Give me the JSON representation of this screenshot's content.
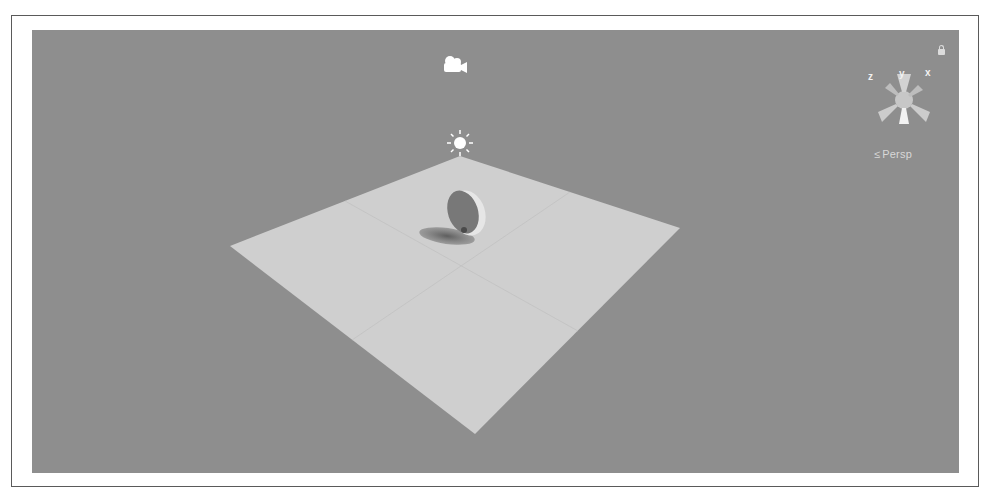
{
  "viewport": {
    "background_color": "#8e8e8e",
    "frame_color": "#5a5a5a",
    "plane_color": "#cfcfcf"
  },
  "scene_gizmo": {
    "axes": {
      "y": "y",
      "x": "x",
      "z": "z"
    },
    "projection_label": "Persp",
    "projection_arrow": "≤"
  },
  "scene_objects": [
    {
      "name": "Main Camera",
      "icon": "camera-icon"
    },
    {
      "name": "Directional Light",
      "icon": "sun-icon"
    },
    {
      "name": "Plane",
      "icon": "plane-mesh"
    },
    {
      "name": "Wheel",
      "icon": "disc-mesh"
    }
  ]
}
